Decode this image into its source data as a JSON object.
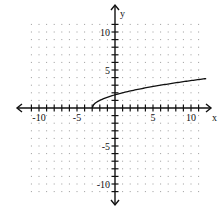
{
  "chart_data": {
    "type": "line",
    "title": "",
    "xlabel": "x",
    "ylabel": "y",
    "xlim": [
      -11,
      11
    ],
    "ylim": [
      -11,
      11
    ],
    "grid": "dotted",
    "x_tick_labels": [
      {
        "value": -10,
        "label": "-10"
      },
      {
        "value": -5,
        "label": "-5"
      },
      {
        "value": 5,
        "label": "5"
      },
      {
        "value": 10,
        "label": "10"
      }
    ],
    "y_tick_labels": [
      {
        "value": 10,
        "label": "10"
      },
      {
        "value": 5,
        "label": "5"
      },
      {
        "value": -5,
        "label": "-5"
      },
      {
        "value": -10,
        "label": "-10"
      }
    ],
    "series": [
      {
        "name": "y = sqrt(x + 3)",
        "function": "sqrt(x+3)",
        "x_start": -3,
        "x_end": 12,
        "points": [
          [
            -3,
            0
          ],
          [
            -2.5,
            0.71
          ],
          [
            -2,
            1
          ],
          [
            -1,
            1.41
          ],
          [
            0,
            1.73
          ],
          [
            1,
            2
          ],
          [
            2,
            2.24
          ],
          [
            3,
            2.45
          ],
          [
            4,
            2.65
          ],
          [
            5,
            2.83
          ],
          [
            6,
            3
          ],
          [
            7,
            3.16
          ],
          [
            8,
            3.32
          ],
          [
            9,
            3.46
          ],
          [
            10,
            3.61
          ],
          [
            11,
            3.74
          ],
          [
            12,
            3.87
          ]
        ]
      }
    ]
  }
}
